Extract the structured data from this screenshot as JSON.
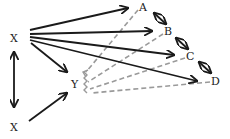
{
  "diagram": {
    "type": "causal-path-diagram",
    "nodes": {
      "x_top": "X",
      "x_bottom": "X",
      "y": "Y",
      "a": "A",
      "b": "B",
      "c": "C",
      "d": "D"
    },
    "edges": [
      {
        "from": "X",
        "to": "A",
        "style": "solid"
      },
      {
        "from": "X",
        "to": "B",
        "style": "solid"
      },
      {
        "from": "X",
        "to": "C",
        "style": "solid"
      },
      {
        "from": "X",
        "to": "D",
        "style": "solid"
      },
      {
        "from": "X",
        "to": "Y",
        "style": "solid"
      },
      {
        "from": "X (bottom)",
        "to": "Y",
        "style": "solid"
      },
      {
        "from": "X",
        "to": "X (bottom)",
        "style": "solid-bidirectional"
      },
      {
        "from": "A",
        "to": "B",
        "style": "solid-bidirectional"
      },
      {
        "from": "B",
        "to": "C",
        "style": "solid-bidirectional"
      },
      {
        "from": "C",
        "to": "D",
        "style": "solid-bidirectional"
      },
      {
        "from": "A",
        "to": "Y",
        "style": "dashed"
      },
      {
        "from": "B",
        "to": "Y",
        "style": "dashed"
      },
      {
        "from": "C",
        "to": "Y",
        "style": "dashed"
      },
      {
        "from": "D",
        "to": "Y",
        "style": "dashed"
      }
    ],
    "colors": {
      "solid": "#1a1a1a",
      "dashed": "#9a9a9a",
      "text": "#222222"
    }
  }
}
